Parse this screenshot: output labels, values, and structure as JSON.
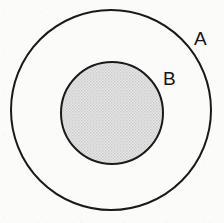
{
  "diagram": {
    "type": "euler-diagram",
    "background_color": "#fbfbfa",
    "stroke_color": "#1a1a1a",
    "shapes": [
      {
        "id": "outer-set",
        "name": "set-a-circle",
        "label": "A",
        "cx": 111,
        "cy": 110,
        "r": 100,
        "fill": "none",
        "fill_color": "#fbfbfa",
        "stroke_width": 2,
        "label_x": 194,
        "label_y": 29
      },
      {
        "id": "inner-set",
        "name": "set-b-circle",
        "label": "B",
        "cx": 112,
        "cy": 113,
        "r": 51,
        "fill": "stipple",
        "fill_color": "#dcdcdc",
        "stroke_width": 2,
        "label_x": 163,
        "label_y": 69
      }
    ],
    "labels": {
      "outer": "A",
      "inner": "B"
    }
  }
}
